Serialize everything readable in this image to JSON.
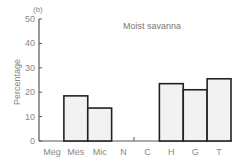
{
  "chart_data": {
    "type": "bar",
    "panel_label": "(b)",
    "title": "Moist savanna",
    "xlabel": "",
    "ylabel": "Percentage",
    "ylim": [
      0,
      50
    ],
    "yticks": [
      0,
      10,
      20,
      30,
      40,
      50
    ],
    "categories": [
      "Meg",
      "Mes",
      "Mic",
      "N",
      "C",
      "H",
      "G",
      "T"
    ],
    "values": [
      0,
      18.5,
      13.5,
      0,
      0,
      23.5,
      21,
      25.5
    ],
    "bar_fill": "#f2f2f2",
    "bar_stroke": "#222222",
    "grid": false,
    "legend": null
  }
}
